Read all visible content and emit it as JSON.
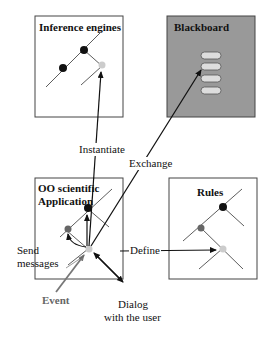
{
  "boxes": {
    "inference_engines": {
      "title": "Inference engines"
    },
    "blackboard": {
      "title": "Blackboard",
      "color": "#999999",
      "slots": 4
    },
    "oo_application": {
      "title_line1": "OO scientific",
      "title_line2": "Application"
    },
    "rules": {
      "title": "Rules"
    }
  },
  "arrows": {
    "instantiate": "Instantiate",
    "exchange": "Exchange",
    "define": "Define",
    "send_messages_line1": "Send",
    "send_messages_line2": "messages",
    "event": "Event",
    "dialog_line1": "Dialog",
    "dialog_line2": "with the user"
  },
  "colors": {
    "node_dark": "#111111",
    "node_gray": "#666666",
    "node_light": "#cccccc",
    "event_arrow": "#777777"
  }
}
